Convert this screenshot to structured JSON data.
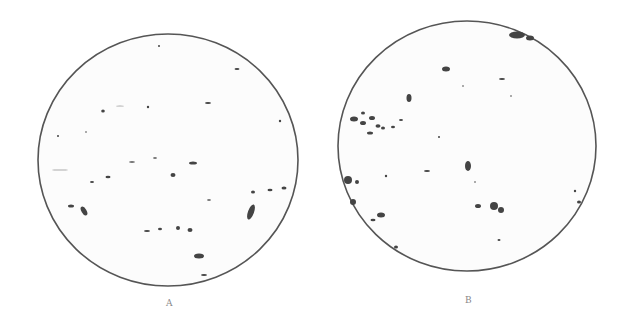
{
  "panels": [
    {
      "label": "A",
      "cx": 168,
      "cy": 160,
      "rx": 130,
      "ry": 126
    },
    {
      "label": "B",
      "cx": 467,
      "cy": 146,
      "rx": 129,
      "ry": 125
    }
  ],
  "colors": {
    "outline": "#555555",
    "particle": "#444444",
    "background": "#ffffff",
    "field": "#fafafa"
  }
}
